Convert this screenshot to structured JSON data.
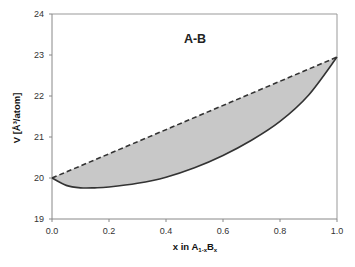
{
  "chart_data": {
    "type": "area",
    "title": "A-B",
    "xlabel": "x in A1-xBx",
    "xlabel_parts": {
      "prefix": "x in A",
      "sub1": "1-x",
      "mid": "B",
      "sub2": "x"
    },
    "ylabel": "V [Å³/atom]",
    "xlim": [
      0.0,
      1.0
    ],
    "ylim": [
      19,
      24
    ],
    "x_ticks": [
      "0.0",
      "0.2",
      "0.4",
      "0.6",
      "0.8",
      "1.0"
    ],
    "y_ticks": [
      "19",
      "20",
      "21",
      "22",
      "23",
      "24"
    ],
    "grid": false,
    "legend": null,
    "series": [
      {
        "name": "Vegard's law (linear)",
        "style": "dashed",
        "x": [
          0.0,
          1.0
        ],
        "y": [
          20.0,
          22.95
        ]
      },
      {
        "name": "Actual volume",
        "style": "solid",
        "x": [
          0.0,
          0.05,
          0.1,
          0.15,
          0.2,
          0.3,
          0.4,
          0.5,
          0.6,
          0.7,
          0.8,
          0.9,
          1.0
        ],
        "y": [
          20.0,
          19.82,
          19.76,
          19.76,
          19.78,
          19.87,
          20.02,
          20.25,
          20.55,
          20.92,
          21.38,
          22.02,
          22.95
        ]
      }
    ],
    "fill_between": {
      "color": "#c8c8c8",
      "between": [
        "Vegard's law (linear)",
        "Actual volume"
      ]
    },
    "colors": {
      "line": "#333333",
      "fill": "#c8c8c8",
      "axis": "#999999"
    }
  }
}
